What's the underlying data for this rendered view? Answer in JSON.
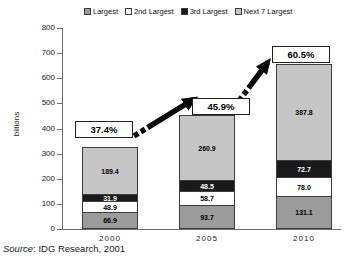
{
  "chart_data": {
    "type": "bar",
    "stacked": true,
    "ylabel": "billions",
    "ylim": [
      0,
      800
    ],
    "yticks": [
      0,
      100,
      200,
      300,
      400,
      500,
      600,
      700,
      800
    ],
    "grid": false,
    "legend_position": "top",
    "categories": [
      "2000",
      "2005",
      "2010"
    ],
    "series": [
      {
        "name": "Largest",
        "color": "#9b9b9b",
        "label_color": "#000000",
        "values": [
          66.9,
          93.7,
          131.1
        ]
      },
      {
        "name": "2nd Largest",
        "color": "#ffffff",
        "label_color": "#000000",
        "values": [
          48.9,
          58.7,
          78.0
        ]
      },
      {
        "name": "3rd Largest",
        "color": "#1a1a1a",
        "label_color": "#ffffff",
        "values": [
          31.9,
          48.5,
          72.7
        ]
      },
      {
        "name": "Next 7 Largest",
        "color": "#c6c6c6",
        "label_color": "#000000",
        "values": [
          189.4,
          260.9,
          387.8
        ]
      }
    ],
    "annotations": [
      {
        "category": "2000",
        "label": "37.4%"
      },
      {
        "category": "2005",
        "label": "45.9%"
      },
      {
        "category": "2010",
        "label": "60.5%"
      }
    ]
  },
  "source": {
    "prefix": "Source",
    "suffix": ": IDG Research, 2001"
  }
}
